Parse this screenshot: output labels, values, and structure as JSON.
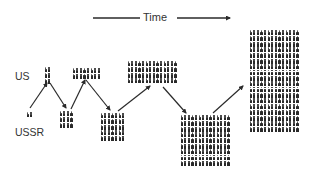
{
  "title": "Time",
  "labels": {
    "top_row": "US",
    "bottom_row": "USSR"
  },
  "colors": {
    "ink": "#2a2a2a",
    "text": "#333333",
    "background": "#ffffff"
  },
  "icon": "person-figure-icon",
  "groups": [
    {
      "id": "ussr-1",
      "country": "USSR",
      "step": 1,
      "cols": 2,
      "rows": 1,
      "count": 2,
      "x": 26,
      "y": 112
    },
    {
      "id": "us-1",
      "country": "US",
      "step": 1,
      "cols": 2,
      "rows": 3,
      "count": 6,
      "x": 44,
      "y": 67
    },
    {
      "id": "ussr-2",
      "country": "USSR",
      "step": 2,
      "cols": 4,
      "rows": 3,
      "count": 12,
      "x": 59,
      "y": 111
    },
    {
      "id": "us-2",
      "country": "US",
      "step": 2,
      "cols": 8,
      "rows": 2,
      "count": 16,
      "x": 72,
      "y": 68
    },
    {
      "id": "ussr-3",
      "country": "USSR",
      "step": 3,
      "cols": 7,
      "rows": 5,
      "count": 35,
      "x": 100,
      "y": 113
    },
    {
      "id": "us-3",
      "country": "US",
      "step": 3,
      "cols": 14,
      "rows": 4,
      "count": 56,
      "x": 127,
      "y": 61
    },
    {
      "id": "ussr-4",
      "country": "USSR",
      "step": 4,
      "cols": 14,
      "rows": 9,
      "count": 126,
      "x": 180,
      "y": 115
    },
    {
      "id": "us-4",
      "country": "US",
      "step": 4,
      "cols": 14,
      "rows": 18,
      "count": 252,
      "x": 249,
      "y": 30
    }
  ],
  "arrows": [
    {
      "from": "ussr-1",
      "to": "us-1",
      "x1": 30,
      "y1": 108,
      "x2": 47,
      "y2": 83
    },
    {
      "from": "us-1",
      "to": "ussr-2",
      "x1": 50,
      "y1": 83,
      "x2": 66,
      "y2": 108
    },
    {
      "from": "ussr-2",
      "to": "us-2",
      "x1": 71,
      "y1": 109,
      "x2": 85,
      "y2": 80
    },
    {
      "from": "us-2",
      "to": "ussr-3",
      "x1": 86,
      "y1": 80,
      "x2": 110,
      "y2": 110
    },
    {
      "from": "ussr-3",
      "to": "us-3",
      "x1": 118,
      "y1": 111,
      "x2": 150,
      "y2": 86
    },
    {
      "from": "us-3",
      "to": "ussr-4",
      "x1": 163,
      "y1": 87,
      "x2": 186,
      "y2": 113
    },
    {
      "from": "ussr-4",
      "to": "us-4",
      "x1": 213,
      "y1": 113,
      "x2": 243,
      "y2": 86
    }
  ],
  "time_axis": {
    "x1": 93,
    "x2": 230,
    "y": 18
  }
}
